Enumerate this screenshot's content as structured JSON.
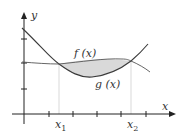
{
  "diagram": {
    "title": "",
    "axes": {
      "x_label": "x",
      "y_label": "y"
    },
    "curves": [
      {
        "name": "f(x)",
        "label": "f (x)",
        "role": "upper curve between x1 and x2"
      },
      {
        "name": "g(x)",
        "label": "g (x)",
        "role": "lower curve between x1 and x2"
      }
    ],
    "markers": [
      {
        "label": "x",
        "sub": "1"
      },
      {
        "label": "x",
        "sub": "2"
      }
    ],
    "shaded_region": {
      "description": "area between f(x) and g(x) from x1 to x2",
      "color": "#d9d9d9"
    },
    "colors": {
      "curve": "#3a3a3a",
      "axis": "#222222",
      "guide": "#cfcfcf"
    }
  }
}
